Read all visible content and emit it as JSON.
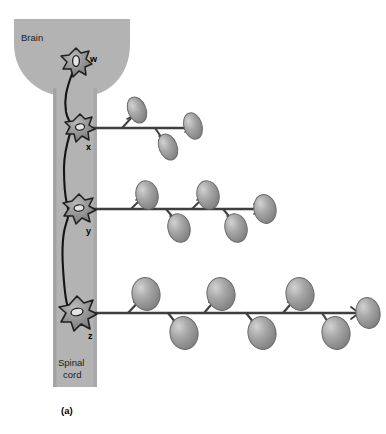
{
  "figure": {
    "panel_label": "(a)",
    "caption_text": "",
    "regions": {
      "brain_label": "Brain",
      "spinal_cord_label_line1": "Spinal",
      "spinal_cord_label_line2": "cord"
    },
    "colors": {
      "cns_fill": "#b3b3b3",
      "cns_stroke": "#9a9a9a",
      "background": "#ffffff",
      "axon_stroke": "#3a3a3a",
      "soma_fill": "#8f8f8f",
      "soma_stroke": "#2b2b2b",
      "soma_nucleus": "#e2e2e2",
      "muscle_fill": "#9b9b9b",
      "muscle_stroke": "#6f6f6f",
      "muscle_highlight": "#cfcfcf",
      "text": "#1b1b1b"
    },
    "neurons": [
      {
        "id": "w",
        "label": "w",
        "location": "brain",
        "soma_cx": 76,
        "soma_cy": 62,
        "soma_r": 13,
        "label_x": 94,
        "label_y": 60,
        "muscle_fiber_count": 0,
        "axon_terminal_count": 0
      },
      {
        "id": "x",
        "label": "x",
        "location": "spinal-cord",
        "soma_cx": 80,
        "soma_cy": 128,
        "soma_r": 11,
        "label_x": 88,
        "label_y": 147,
        "axon_y": 128,
        "axon_x_start": 92,
        "axon_x_end": 192,
        "muscle_fiber_count": 3,
        "muscle_fiber_size": "small",
        "muscle_fibers": [
          {
            "cx": 136,
            "cy": 110,
            "rx": 9,
            "ry": 13,
            "rot": -22,
            "side": "up",
            "stalk_x": 126
          },
          {
            "cx": 166,
            "cy": 147,
            "rx": 9,
            "ry": 13,
            "rot": -22,
            "side": "down",
            "stalk_x": 158
          },
          {
            "cx": 192,
            "cy": 126,
            "rx": 9,
            "ry": 13,
            "rot": -20,
            "side": "end",
            "stalk_x": 186
          }
        ]
      },
      {
        "id": "y",
        "label": "y",
        "location": "spinal-cord",
        "soma_cx": 79,
        "soma_cy": 209,
        "soma_r": 12,
        "label_x": 88,
        "label_y": 231,
        "axon_y": 209,
        "axon_x_start": 92,
        "axon_x_end": 270,
        "muscle_fiber_count": 5,
        "muscle_fiber_size": "medium",
        "muscle_fibers": [
          {
            "cx": 146,
            "cy": 194,
            "rx": 11,
            "ry": 14,
            "rot": -15,
            "side": "up",
            "stalk_x": 136
          },
          {
            "cx": 176,
            "cy": 227,
            "rx": 11,
            "ry": 14,
            "rot": -15,
            "side": "down",
            "stalk_x": 168
          },
          {
            "cx": 206,
            "cy": 194,
            "rx": 11,
            "ry": 14,
            "rot": -15,
            "side": "up",
            "stalk_x": 197
          },
          {
            "cx": 234,
            "cy": 227,
            "rx": 11,
            "ry": 14,
            "rot": -15,
            "side": "down",
            "stalk_x": 227
          },
          {
            "cx": 262,
            "cy": 209,
            "rx": 11,
            "ry": 14,
            "rot": -15,
            "side": "end",
            "stalk_x": 254
          }
        ]
      },
      {
        "id": "z",
        "label": "z",
        "location": "spinal-cord",
        "soma_cx": 77,
        "soma_cy": 314,
        "soma_r": 14,
        "label_x": 90,
        "label_y": 336,
        "axon_y": 313,
        "axon_x_start": 92,
        "axon_x_end": 372,
        "muscle_fiber_count": 7,
        "muscle_fiber_size": "large",
        "muscle_fibers": [
          {
            "cx": 146,
            "cy": 294,
            "rx": 14,
            "ry": 16,
            "rot": -10,
            "side": "up",
            "stalk_x": 134
          },
          {
            "cx": 182,
            "cy": 332,
            "rx": 14,
            "ry": 16,
            "rot": -10,
            "side": "down",
            "stalk_x": 172
          },
          {
            "cx": 220,
            "cy": 294,
            "rx": 14,
            "ry": 16,
            "rot": -10,
            "side": "up",
            "stalk_x": 208
          },
          {
            "cx": 260,
            "cy": 332,
            "rx": 14,
            "ry": 16,
            "rot": -10,
            "side": "down",
            "stalk_x": 250
          },
          {
            "cx": 299,
            "cy": 294,
            "rx": 14,
            "ry": 16,
            "rot": -10,
            "side": "up",
            "stalk_x": 287
          },
          {
            "cx": 334,
            "cy": 332,
            "rx": 14,
            "ry": 16,
            "rot": -10,
            "side": "down",
            "stalk_x": 325
          },
          {
            "cx": 366,
            "cy": 313,
            "rx": 12,
            "ry": 15,
            "rot": -10,
            "side": "end",
            "stalk_x": 356
          }
        ]
      }
    ],
    "descending_tract": {
      "from_neuron": "w",
      "to_neuron": "z",
      "description": "upper motor neuron axon descending through spinal cord"
    },
    "geometry": {
      "brain_left": 14,
      "brain_right": 130,
      "brain_top": 19,
      "brain_bottom": 96,
      "cord_left": 53,
      "cord_right": 97,
      "cord_top": 90,
      "cord_bottom": 387
    }
  }
}
